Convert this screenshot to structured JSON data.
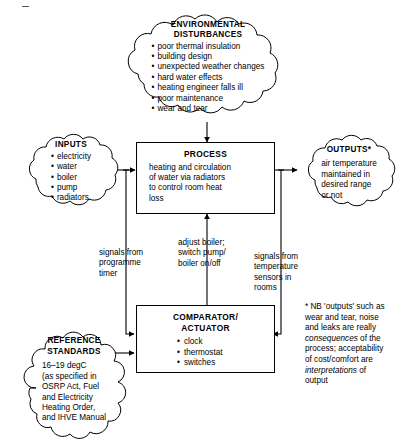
{
  "diagram": {
    "ink_color": "#000000",
    "background": "#ffffff"
  },
  "nodes": {
    "environmental_disturbances": {
      "title_line1": "ENVIRONMENTAL",
      "title_line2": "DISTURBANCES",
      "items": [
        "poor thermal insulation",
        "building design",
        "unexpected weather changes",
        "hard water effects",
        "heating engineer falls ill",
        "poor maintenance",
        "wear and tear"
      ]
    },
    "inputs": {
      "title": "INPUTS",
      "items": [
        "electricity",
        "water",
        "boiler",
        "pump",
        "radiators"
      ]
    },
    "process": {
      "title": "PROCESS",
      "description_lines": [
        "heating and circulation",
        "of water via radiators",
        "to control room heat",
        "loss"
      ]
    },
    "outputs": {
      "title": "OUTPUTS*",
      "description_lines": [
        "air temperature",
        "maintained in",
        "desired range",
        "or not"
      ]
    },
    "comparator": {
      "title_line1": "COMPARATOR/",
      "title_line2": "ACTUATOR",
      "items": [
        "clock",
        "thermostat",
        "switches"
      ]
    },
    "reference_standards": {
      "title_line1": "REFERENCE",
      "title_line2": "STANDARDS",
      "description_lines": [
        "16–19 degC",
        "(as specified in",
        "OSRP Act, Fuel",
        "and Electricity",
        "Heating Order,",
        "and IHVE Manual"
      ]
    }
  },
  "connector_labels": {
    "programme_timer": [
      "signals from",
      "programme",
      "timer"
    ],
    "adjust_boiler": [
      "adjust boiler;",
      "switch pump/",
      "boiler on/off"
    ],
    "temperature_sensors": [
      "signals from",
      "temperature",
      "sensors in",
      "rooms"
    ]
  },
  "footnote": {
    "line1": "* NB 'outputs' such as",
    "line2": "wear and tear, noise",
    "line3": "and leaks are really",
    "line4_italic": "consequences",
    "line4_rest": " of the",
    "line5": "process; acceptability",
    "line6": "of cost/comfort are",
    "line7_italic": "interpretations",
    "line7_rest": " of",
    "line8": "output"
  }
}
